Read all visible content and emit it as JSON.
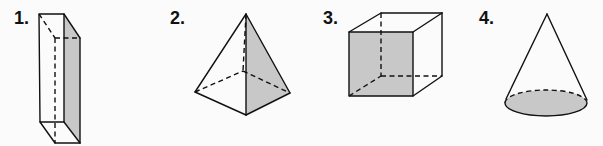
{
  "figures": [
    {
      "label": "1.",
      "name": "rectangular-prism",
      "shaded_face": "right side face"
    },
    {
      "label": "2.",
      "name": "square-pyramid",
      "shaded_face": "right triangular face"
    },
    {
      "label": "3.",
      "name": "cube",
      "shaded_face": "front face"
    },
    {
      "label": "4.",
      "name": "cone",
      "shaded_face": "circular base"
    }
  ],
  "colors": {
    "background": "#fbfbfb",
    "line": "#111111",
    "shade": "#c8c8c8"
  }
}
